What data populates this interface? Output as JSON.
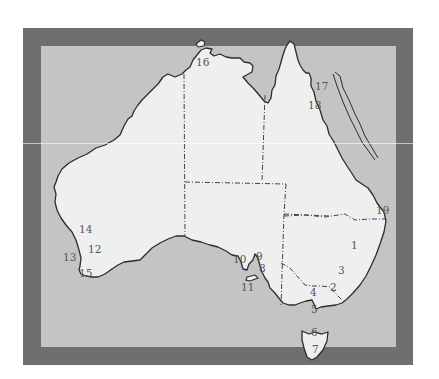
{
  "map": {
    "title": "Australia outline map with numbered locations",
    "colors": {
      "frame": "#6f6f6f",
      "sea": "#c4c4c4",
      "land": "#efefef",
      "coastline": "#2c2c2c",
      "state_border": "#444444",
      "label": "#555555",
      "background": "#ffffff"
    },
    "frame": {
      "outer": [
        23,
        28,
        413,
        365
      ],
      "inner": [
        41,
        46,
        396,
        347
      ]
    },
    "labels": [
      {
        "id": "1",
        "text": "1",
        "x": 351,
        "y": 249
      },
      {
        "id": "2",
        "text": "2",
        "x": 330,
        "y": 291
      },
      {
        "id": "3",
        "text": "3",
        "x": 338,
        "y": 274
      },
      {
        "id": "4",
        "text": "4",
        "x": 310,
        "y": 296
      },
      {
        "id": "5",
        "text": "5",
        "x": 311,
        "y": 313
      },
      {
        "id": "6",
        "text": "6",
        "x": 311,
        "y": 336
      },
      {
        "id": "7",
        "text": "7",
        "x": 312,
        "y": 353
      },
      {
        "id": "8",
        "text": "8",
        "x": 259,
        "y": 272
      },
      {
        "id": "9",
        "text": "9",
        "x": 256,
        "y": 260
      },
      {
        "id": "10",
        "text": "10",
        "x": 233,
        "y": 263
      },
      {
        "id": "11",
        "text": "11",
        "x": 241,
        "y": 291
      },
      {
        "id": "12",
        "text": "12",
        "x": 88,
        "y": 253
      },
      {
        "id": "13",
        "text": "13",
        "x": 63,
        "y": 261
      },
      {
        "id": "14",
        "text": "14",
        "x": 79,
        "y": 233
      },
      {
        "id": "15",
        "text": "15",
        "x": 79,
        "y": 277
      },
      {
        "id": "16",
        "text": "16",
        "x": 196,
        "y": 66
      },
      {
        "id": "17",
        "text": "17",
        "x": 315,
        "y": 90
      },
      {
        "id": "18",
        "text": "18",
        "x": 308,
        "y": 109
      },
      {
        "id": "19",
        "text": "19",
        "x": 376,
        "y": 214
      }
    ]
  }
}
